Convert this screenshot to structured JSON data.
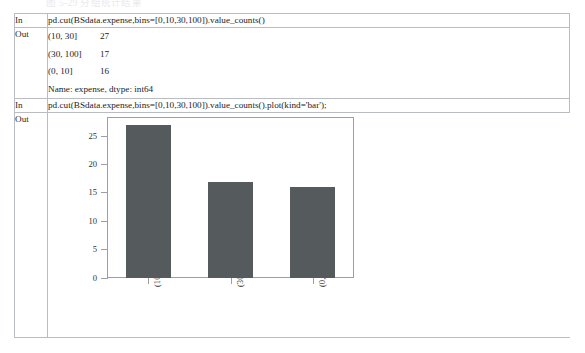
{
  "page": {
    "top_sliver_text": "图 5-29  分组统计结果",
    "border_color": "#b9bcc0"
  },
  "notebook": {
    "rows": [
      {
        "label": "In",
        "type": "code",
        "code": "pd.cut(BSdata.expense,bins=[0,10,30,100]).value_counts()"
      },
      {
        "label": "Out",
        "type": "text",
        "lines": [
          {
            "index": "(10, 30]",
            "value": "27"
          },
          {
            "index": "(30, 100]",
            "value": "17"
          },
          {
            "index": "(0, 10]",
            "value": "16"
          },
          {
            "index": "Name: expense, dtype: int64",
            "value": ""
          }
        ]
      },
      {
        "label": "In",
        "type": "code",
        "code": "pd.cut(BSdata.expense,bins=[0,10,30,100]).value_counts().plot(kind='bar');"
      },
      {
        "label": "Out",
        "type": "chart"
      }
    ]
  },
  "chart_data": {
    "type": "bar",
    "title": "",
    "xlabel": "",
    "ylabel": "",
    "categories": [
      "(10, 30]",
      "(30, 100]",
      "(0, 10]"
    ],
    "values": [
      27,
      17,
      16
    ],
    "ylim": [
      0,
      28.4
    ],
    "yticks": [
      0,
      5,
      10,
      15,
      20,
      25
    ],
    "ytick_labels": [
      "0",
      "5",
      "10",
      "15",
      "20",
      "25"
    ],
    "grid": false,
    "legend": false,
    "bar_color": "#555a5c",
    "axis_color": "#9b9ea2",
    "tick_label_rotation": -90,
    "bar_width_fraction": 0.55
  }
}
